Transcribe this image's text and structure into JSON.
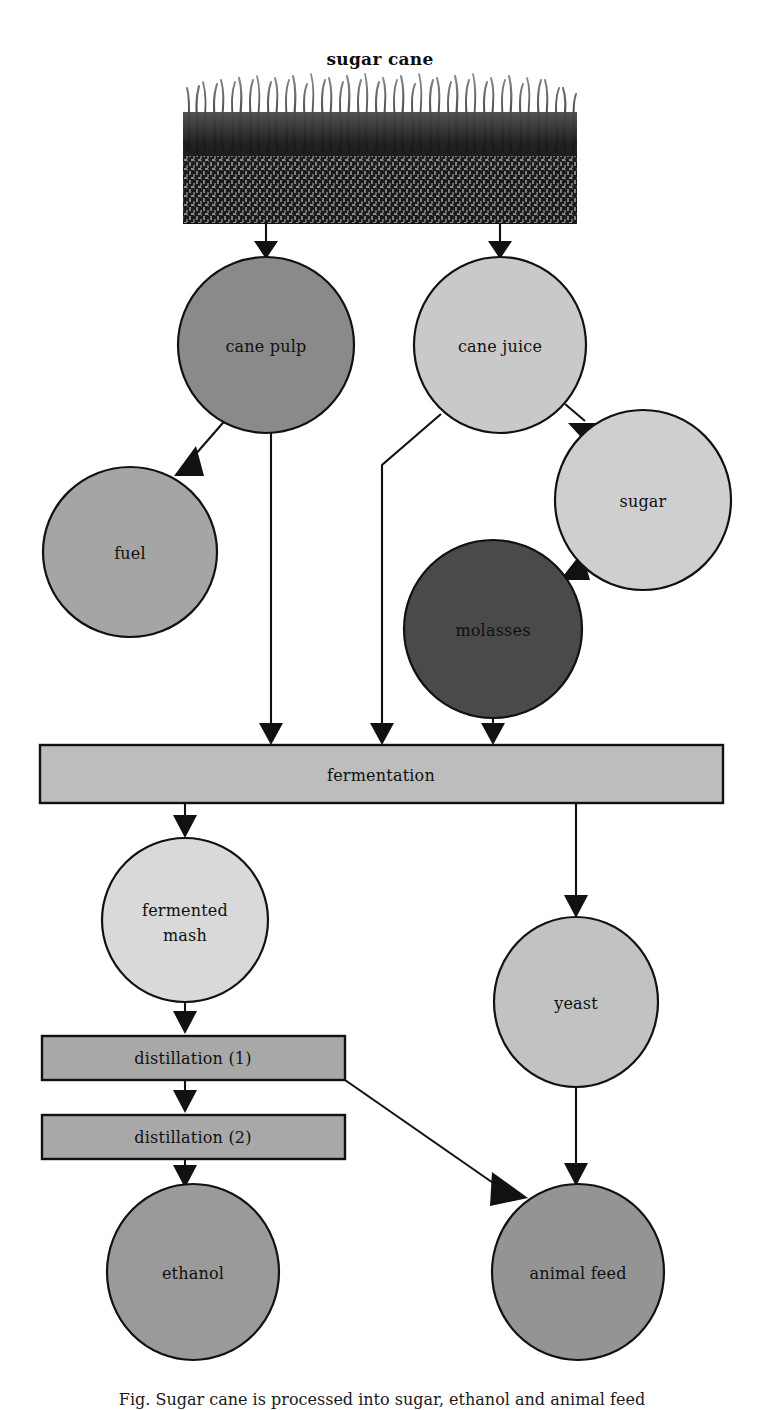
{
  "diagram": {
    "title": "sugar cane",
    "caption": "Fig. Sugar cane is processed into sugar, ethanol and animal feed",
    "background_color": "#ffffff",
    "line_color": "#111111",
    "source_image": {
      "name": "sugar-cane-field-photo",
      "alt": "black and white engraving of a sugar cane field"
    },
    "palette": {
      "cane_pulp": "#8a8a8a",
      "cane_juice": "#c9c9c9",
      "fuel": "#a5a5a5",
      "sugar": "#cfcfcf",
      "molasses": "#4a4a4a",
      "fermentation": "#bdbdbd",
      "fermented_mash": "#d9d9d9",
      "distillation": "#a8a8a8",
      "yeast": "#c2c2c2",
      "ethanol": "#9a9a9a",
      "animal_feed": "#949494"
    },
    "nodes": [
      {
        "id": "cane_pulp",
        "label": "cane pulp",
        "shape": "ellipse",
        "cx": 266,
        "cy": 345,
        "rx": 88,
        "ry": 88,
        "fill": "#8a8a8a"
      },
      {
        "id": "cane_juice",
        "label": "cane juice",
        "shape": "ellipse",
        "cx": 500,
        "cy": 345,
        "rx": 86,
        "ry": 88,
        "fill": "#c9c9c9"
      },
      {
        "id": "fuel",
        "label": "fuel",
        "shape": "ellipse",
        "cx": 130,
        "cy": 552,
        "rx": 87,
        "ry": 85,
        "fill": "#a5a5a5"
      },
      {
        "id": "sugar",
        "label": "sugar",
        "shape": "ellipse",
        "cx": 643,
        "cy": 500,
        "rx": 88,
        "ry": 90,
        "fill": "#cfcfcf"
      },
      {
        "id": "molasses",
        "label": "molasses",
        "shape": "ellipse",
        "cx": 493,
        "cy": 629,
        "rx": 89,
        "ry": 89,
        "fill": "#4a4a4a",
        "text_color": "#0d0d0d"
      },
      {
        "id": "fermentation",
        "label": "fermentation",
        "shape": "rect",
        "x": 40,
        "y": 745,
        "w": 683,
        "h": 58,
        "fill": "#bdbdbd"
      },
      {
        "id": "fermented_mash",
        "label": "fermented mash",
        "shape": "ellipse",
        "cx": 185,
        "cy": 920,
        "rx": 83,
        "ry": 82,
        "fill": "#d9d9d9",
        "lines": [
          "fermented",
          "mash"
        ]
      },
      {
        "id": "yeast",
        "label": "yeast",
        "shape": "ellipse",
        "cx": 576,
        "cy": 1002,
        "rx": 82,
        "ry": 85,
        "fill": "#c2c2c2"
      },
      {
        "id": "distillation_1",
        "label": "distillation (1)",
        "shape": "rect",
        "x": 42,
        "y": 1036,
        "w": 303,
        "h": 44,
        "fill": "#a8a8a8"
      },
      {
        "id": "distillation_2",
        "label": "distillation (2)",
        "shape": "rect",
        "x": 42,
        "y": 1115,
        "w": 303,
        "h": 44,
        "fill": "#a8a8a8"
      },
      {
        "id": "ethanol",
        "label": "ethanol",
        "shape": "ellipse",
        "cx": 193,
        "cy": 1272,
        "rx": 86,
        "ry": 88,
        "fill": "#9a9a9a"
      },
      {
        "id": "animal_feed",
        "label": "animal feed",
        "shape": "ellipse",
        "cx": 578,
        "cy": 1272,
        "rx": 86,
        "ry": 88,
        "fill": "#949494"
      }
    ],
    "edges": [
      {
        "id": "cane-to-pulp",
        "from": "sugar_cane",
        "to": "cane_pulp"
      },
      {
        "id": "cane-to-juice",
        "from": "sugar_cane",
        "to": "cane_juice"
      },
      {
        "id": "pulp-to-fuel",
        "from": "cane_pulp",
        "to": "fuel"
      },
      {
        "id": "pulp-to-fermentation",
        "from": "cane_pulp",
        "to": "fermentation"
      },
      {
        "id": "juice-to-sugar",
        "from": "cane_juice",
        "to": "sugar"
      },
      {
        "id": "juice-to-fermentation",
        "from": "cane_juice",
        "to": "fermentation"
      },
      {
        "id": "sugar-to-molasses",
        "from": "sugar",
        "to": "molasses"
      },
      {
        "id": "molasses-to-fermentation",
        "from": "molasses",
        "to": "fermentation"
      },
      {
        "id": "fermentation-to-mash",
        "from": "fermentation",
        "to": "fermented_mash"
      },
      {
        "id": "fermentation-to-yeast",
        "from": "fermentation",
        "to": "yeast"
      },
      {
        "id": "mash-to-distillation1",
        "from": "fermented_mash",
        "to": "distillation_1"
      },
      {
        "id": "distillation1-to-distillation2",
        "from": "distillation_1",
        "to": "distillation_2"
      },
      {
        "id": "distillation1-to-feed",
        "from": "distillation_1",
        "to": "animal_feed"
      },
      {
        "id": "distillation2-to-ethanol",
        "from": "distillation_2",
        "to": "ethanol"
      },
      {
        "id": "yeast-to-feed",
        "from": "yeast",
        "to": "animal_feed"
      }
    ]
  }
}
